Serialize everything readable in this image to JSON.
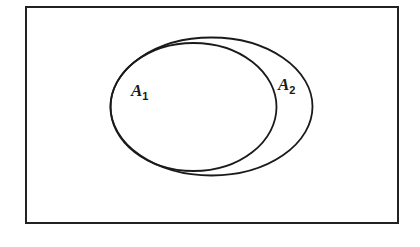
{
  "diagram": {
    "type": "venn",
    "universe": {
      "x": 26,
      "y": 7,
      "width": 372,
      "height": 216,
      "stroke": "#222222"
    },
    "sets": [
      {
        "name": "A1",
        "letter": "A",
        "subscript": "1",
        "cx": 193.5,
        "cy": 107,
        "rx": 83,
        "ry": 64,
        "label_x": 131,
        "label_y": 96
      },
      {
        "name": "A2",
        "letter": "A",
        "subscript": "2",
        "cx": 211.5,
        "cy": 106.5,
        "rx": 101,
        "ry": 69,
        "label_x": 278,
        "label_y": 90
      }
    ],
    "relation": "A1 is a subset of A2"
  }
}
